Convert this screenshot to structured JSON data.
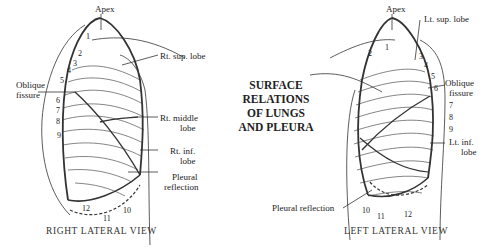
{
  "title": {
    "line1": "SURFACE",
    "line2": "RELATIONS",
    "line3": "OF LUNGS",
    "line4": "AND PLEURA"
  },
  "right_view": {
    "caption": "RIGHT LATERAL VIEW",
    "labels": {
      "apex": "Apex",
      "sup_lobe": "Rt. sup. lobe",
      "oblique1": "Oblique",
      "oblique2": "fissure",
      "middle1": "Rt. middle",
      "middle2": "lobe",
      "inf1": "Rt. inf.",
      "inf2": "lobe",
      "pleural1": "Pleural",
      "pleural2": "reflection"
    },
    "ribs": [
      "1",
      "2",
      "3",
      "4",
      "5",
      "6",
      "7",
      "8",
      "9",
      "10",
      "11",
      "12"
    ]
  },
  "left_view": {
    "caption": "LEFT LATERAL VIEW",
    "labels": {
      "apex": "Apex",
      "sup_lobe": "Lt. sup. lobe",
      "oblique1": "Oblique",
      "oblique2": "fissure",
      "inf1": "Lt. inf.",
      "inf2": "lobe",
      "pleural": "Pleural reflection"
    },
    "ribs": [
      "1",
      "2",
      "3",
      "4",
      "5",
      "6",
      "7",
      "8",
      "9",
      "10",
      "11",
      "12"
    ]
  },
  "colors": {
    "ink": "#222222",
    "background": "#ffffff"
  }
}
